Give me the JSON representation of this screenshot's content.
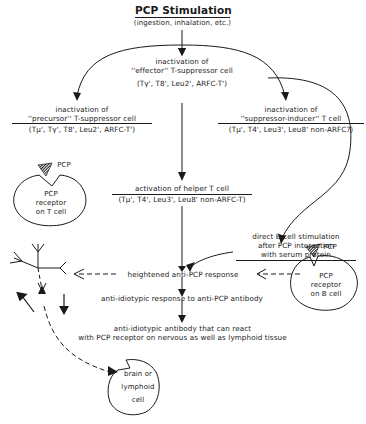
{
  "diagram": {
    "title": "PCP Stimulation",
    "subtitle": "(ingestion, inhalation, etc.)",
    "nodes": {
      "effector": {
        "line1": "inactivation of",
        "line2": "''effector'' T-suppressor cell",
        "markers": "(Tγ', T8', Leu2', ARFC-T')"
      },
      "precursor": {
        "line1": "inactivation of",
        "line2": "''precursor'' T-suppressor cell",
        "markers": "(Tμ', Tγ', T8', Leu2', ARFC-T')"
      },
      "suppressor_inducer": {
        "line1": "inactivation of",
        "line2": "''suppressor-inducer'' T cell",
        "markers": "(Tμ', T4', Leu3', Leu8' non-ARFC?)"
      },
      "helper": {
        "line1": "activation of helper T cell",
        "markers": "(Tμ', T4', Leu3', Leu8' non-ARFC-T)"
      },
      "b_cell_direct": {
        "line1": "direct B cell stimulation",
        "line2": "after PCP interaction",
        "line3": "with serum protein"
      },
      "heightened": {
        "label": "heightened anti-PCP response"
      },
      "anti_idiotypic_response": {
        "label": "anti-idiotypic response to anti-PCP antibody"
      },
      "anti_idiotypic_antibody": {
        "line1": "anti-idiotypic antibody that can react",
        "line2": "with PCP receptor on nervous as well as lymphoid tissue"
      }
    },
    "cells": {
      "t_cell": {
        "pcp_label": "PCP",
        "line1": "PCP",
        "line2": "receptor",
        "line3": "on T cell"
      },
      "b_cell": {
        "pcp_label": "PCP",
        "line1": "PCP",
        "line2": "receptor",
        "line3": "on B cell"
      },
      "brain": {
        "line1": "brain or",
        "line2": "lymphoid",
        "line3": "cell"
      }
    }
  }
}
